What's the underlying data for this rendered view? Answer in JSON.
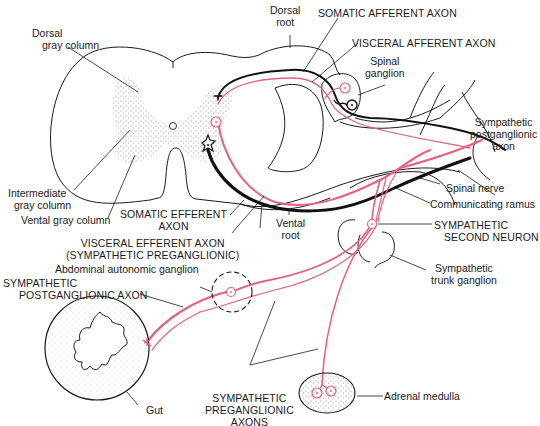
{
  "diagram": {
    "colors": {
      "ink": "#1a1a1a",
      "visceral_pathway": "#e8607a",
      "stipple": "#8a8a8a"
    },
    "labels": {
      "dorsal_gray_column": [
        "Dorsal",
        "gray column"
      ],
      "dorsal_root": [
        "Dorsal",
        "root"
      ],
      "somatic_afferent_axon": "SOMATIC AFFERENT AXON",
      "visceral_afferent_axon": "VISCERAL AFFERENT AXON",
      "spinal_ganglion": [
        "Spinal",
        "ganglion"
      ],
      "sympathetic_postganglionic_axon_right": [
        "Sympathetic",
        "postganglionic",
        "axon"
      ],
      "intermediate_gray_column": [
        "Intermediate",
        "gray column"
      ],
      "vental_gray_column": "Vental gray column",
      "somatic_efferent_axon": [
        "SOMATIC EFFERENT",
        "AXON"
      ],
      "vental_root": [
        "Vental",
        "root"
      ],
      "spinal_nerve": "Spinal nerve",
      "communicating_ramus": "Communicating ramus",
      "sympathetic_second_neuron": [
        "SYMPATHETIC",
        "SECOND NEURON"
      ],
      "visceral_efferent_axon": [
        "VISCERAL EFFERENT AXON",
        "(SYMPATHETIC PREGANGLIONIC)"
      ],
      "abdominal_autonomic_ganglion": "Abdominal autonomic ganglion",
      "sympathetic_trunk_ganglion": [
        "Sympathetic",
        "trunk ganglion"
      ],
      "sympathetic_postganglionic_axon_left": [
        "SYMPATHETIC",
        "POSTGANGLIONIC AXON"
      ],
      "gut": "Gut",
      "sympathetic_preganglionic_axons": [
        "SYMPATHETIC",
        "PREGANGLIONIC",
        "AXONS"
      ],
      "adrenal_medulla": "Adrenal medulla"
    }
  }
}
